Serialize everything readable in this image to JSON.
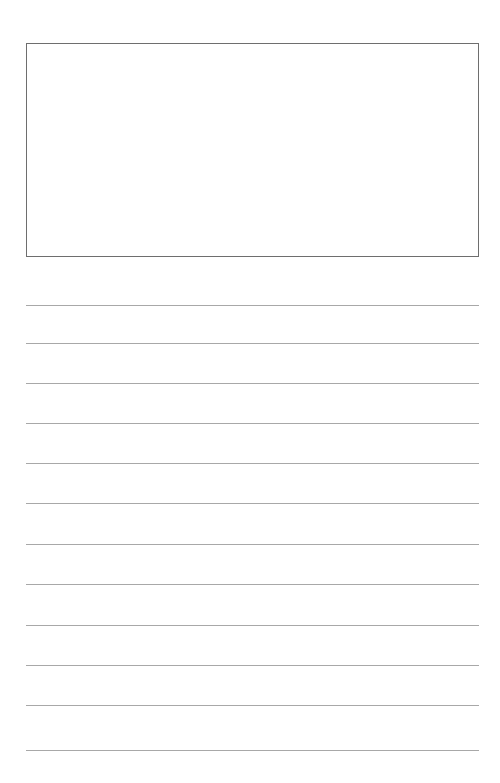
{
  "page": {
    "type": "writing-paper-template",
    "background": "#ffffff",
    "drawing_box": {
      "border_color": "#6e6e6e",
      "content": ""
    },
    "ruled_lines": {
      "count": 12,
      "color": "#a8a8a8",
      "positions_y": [
        305,
        343,
        383,
        423,
        463,
        503,
        544,
        584,
        625,
        665,
        705,
        750
      ]
    }
  }
}
